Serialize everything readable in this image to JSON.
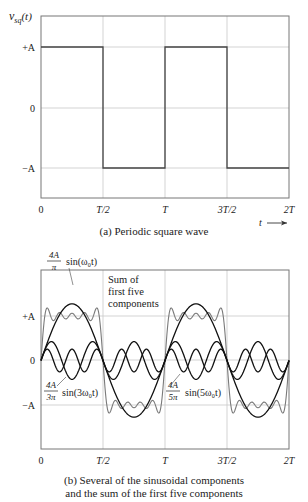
{
  "chart_data": [
    {
      "type": "line",
      "id": "a",
      "title": "(a) Periodic square wave",
      "ylabel": "v_sq(t)",
      "xlabel": "t",
      "x_ticks": [
        "0",
        "T/2",
        "T",
        "3T/2",
        "2T"
      ],
      "y_ticks": [
        "+A",
        "0",
        "−A"
      ],
      "xlim": [
        0,
        2
      ],
      "ylim": [
        -1.5,
        1.5
      ],
      "grid": true,
      "series": [
        {
          "name": "v_sq(t)",
          "color": "#444444",
          "x": [
            0,
            0.5,
            0.5,
            1.0,
            1.0,
            1.5,
            1.5,
            2.0
          ],
          "y": [
            1,
            1,
            -1,
            -1,
            1,
            1,
            -1,
            -1
          ]
        }
      ]
    },
    {
      "type": "line",
      "id": "b",
      "title": "(b) Several of the sinusoidal components and the sum of the first five components",
      "x_ticks": [
        "0",
        "T/2",
        "T",
        "3T/2",
        "2T"
      ],
      "y_ticks": [
        "+A",
        "0",
        "−A"
      ],
      "xlim": [
        0,
        2
      ],
      "ylim": [
        -2,
        2
      ],
      "grid": true,
      "series": [
        {
          "name": "(4A/π) sin(ω₀t)",
          "harmonics": [
            1
          ],
          "amplitude": 1.2732,
          "color": "#111111"
        },
        {
          "name": "(4A/3π) sin(3ω₀t)",
          "harmonics": [
            3
          ],
          "amplitude": 0.4244,
          "color": "#111111"
        },
        {
          "name": "(4A/5π) sin(5ω₀t)",
          "harmonics": [
            5
          ],
          "amplitude": 0.2546,
          "color": "#111111"
        },
        {
          "name": "Sum of first five components",
          "harmonics": [
            1,
            3,
            5,
            7,
            9
          ],
          "color": "#777777"
        }
      ],
      "annotations": [
        {
          "text": "Sum of first five components"
        },
        {
          "text": "4A/π sin(ω₀t)"
        },
        {
          "text": "4A/3π sin(3ω₀t)"
        },
        {
          "text": "4A/5π sin(5ω₀t)"
        }
      ]
    }
  ],
  "figure": {
    "a": {
      "ylabel_main": "v",
      "ylabel_sub": "sq",
      "ylabel_arg": "(t)",
      "y_ticks": [
        "+A",
        "0",
        "−A"
      ],
      "x_ticks": [
        "0",
        "T/2",
        "T",
        "3T/2",
        "2T"
      ],
      "t_axis": "t",
      "arrow": "→",
      "caption": "(a) Periodic square wave"
    },
    "b": {
      "y_ticks": [
        "+A",
        "0",
        "−A"
      ],
      "x_ticks": [
        "0",
        "T/2",
        "T",
        "3T/2",
        "2T"
      ],
      "sum_label": [
        "Sum of",
        "first five",
        "components"
      ],
      "fund_num": "4A",
      "fund_den": "π",
      "fund_fn": "sin(ω₀t)",
      "h3_num": "4A",
      "h3_den": "3π",
      "h3_fn": "sin(3ω₀t)",
      "h5_num": "4A",
      "h5_den": "5π",
      "h5_fn": "sin(5ω₀t)",
      "caption_line1": "(b) Several of the sinusoidal components",
      "caption_line2": "and the sum of the first five components"
    }
  }
}
